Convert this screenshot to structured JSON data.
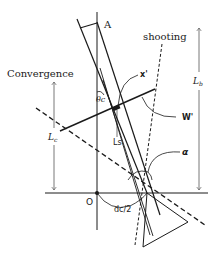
{
  "labels": {
    "a": "A",
    "shooting": "shooting",
    "convergence": "Convergence",
    "x_prime": "x'",
    "w_prime": "W'",
    "theta_c": "θc",
    "lb": "L",
    "lb_sub": "b",
    "lc": "L",
    "lc_sub": "c",
    "ls": "Ls",
    "alpha": "α",
    "origin": "O",
    "dc_half": "dc/2"
  },
  "colors": {
    "line": "#1a1a1a",
    "arrow": "#555555",
    "background": "#ffffff"
  }
}
